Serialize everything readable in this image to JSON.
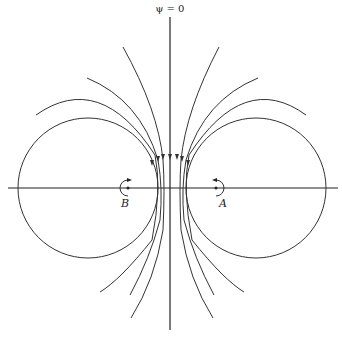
{
  "figure": {
    "type": "streamline-diagram",
    "axis_label": "ψ = 0",
    "points": [
      {
        "id": "A",
        "label": "A",
        "x": 216,
        "y": 188,
        "rotation": "counterclockwise"
      },
      {
        "id": "B",
        "label": "B",
        "x": 128,
        "y": 188,
        "rotation": "clockwise"
      }
    ],
    "circles": [
      {
        "name": "left-circle",
        "cx": 88,
        "cy": 188,
        "r": 70
      },
      {
        "name": "right-circle",
        "cx": 256,
        "cy": 188,
        "r": 70
      }
    ],
    "streamlines": {
      "count": 6,
      "direction": "downward",
      "arrow_count": 7
    },
    "colors": {
      "line": "#333333",
      "background": "#ffffff"
    }
  }
}
